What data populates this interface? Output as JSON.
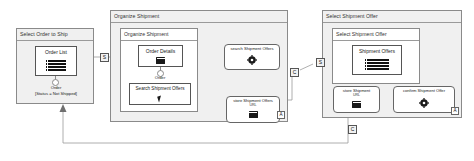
{
  "diagram": {
    "panels": [
      {
        "id": "select-order-to-ship",
        "outer_title": "Select Order to Ship",
        "inner_title": "",
        "widget": {
          "label": "Order List",
          "glyph": "list-icon"
        },
        "entity_label": "Order",
        "constraint_label": "[Status = Not Shipped]"
      },
      {
        "id": "organize-shipment",
        "outer_title": "Organize Shipment",
        "inner_title": "Organize Shipment",
        "widget": {
          "label": "Order Details",
          "glyph": "data-icon"
        },
        "entity_label": "Order",
        "action_widget": {
          "label": "Search Shipment Offers",
          "glyph": "cursor-icon"
        },
        "services": [
          {
            "label": "search Shipment Offers",
            "sub": "",
            "glyph": "gear-icon"
          },
          {
            "label": "store Shipment Offers",
            "sub": "URL",
            "glyph": "data-icon"
          }
        ],
        "corner_marker": "A"
      },
      {
        "id": "select-shipment-offer",
        "outer_title": "Select Shipment Offer",
        "inner_title": "Select Shipment Offer",
        "widget": {
          "label": "Shipment Offers",
          "glyph": "list-icon"
        },
        "services": [
          {
            "label": "store Shipment",
            "sub": "URL",
            "glyph": "data-icon"
          },
          {
            "label": "confirm Shipment Offer",
            "sub": "",
            "glyph": "gear-icon"
          }
        ],
        "corner_marker": "A"
      }
    ],
    "connector_markers": [
      {
        "id": "marker-s-1",
        "label": "S"
      },
      {
        "id": "marker-c-1",
        "label": "C"
      },
      {
        "id": "marker-s-2",
        "label": "S"
      },
      {
        "id": "marker-c-2",
        "label": "C"
      }
    ],
    "colors": {
      "panel_fill": "#f0f0f0",
      "panel_border": "#8a8a8a",
      "wire": "#9a9a9a",
      "glyph": "#1a1a1a"
    }
  }
}
